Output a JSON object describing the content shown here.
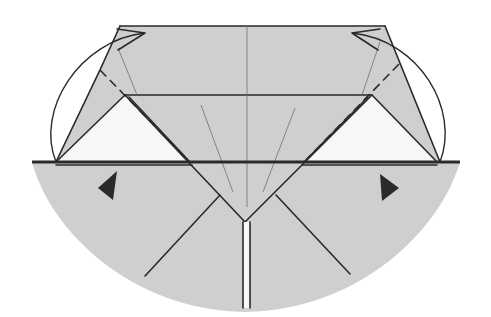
{
  "diagram": {
    "colors": {
      "paper": "#cfcfcf",
      "white_layer": "#f7f7f7",
      "ink": "#2a2a2a",
      "crease": "#6e6e6e"
    },
    "elements": {
      "left_flap": {
        "fold": "valley",
        "arrow": "curved-fold-arrow"
      },
      "right_flap": {
        "fold": "valley",
        "arrow": "curved-fold-arrow"
      },
      "left_marker": {
        "shape": "triangle",
        "direction": "left"
      },
      "right_marker": {
        "shape": "triangle",
        "direction": "right"
      },
      "center_strip": {
        "shape": "vertical double line"
      }
    }
  }
}
